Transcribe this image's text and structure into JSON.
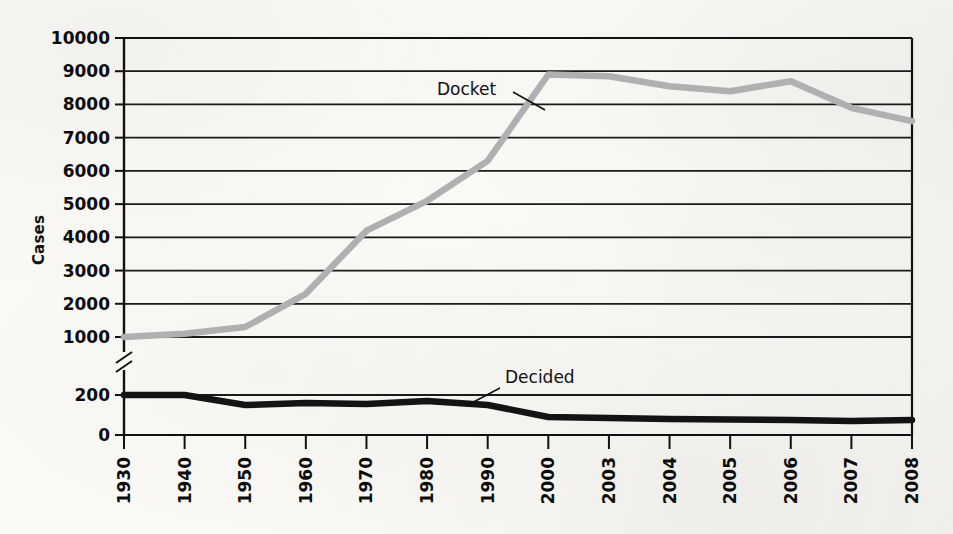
{
  "figure": {
    "y_axis_title": "Cases",
    "colors": {
      "docket_line": "#b0b0b0",
      "decided_line": "#131313",
      "axis": "#111111",
      "gridline": "#1a1a1a",
      "paper": "#fbfaf7"
    }
  },
  "annotations": {
    "docket_label": "Docket",
    "decided_label": "Decided"
  },
  "axis_break": {
    "present": true,
    "between": "1000 and 200"
  },
  "chart_data": {
    "type": "line",
    "title": "",
    "subtitle": "",
    "xlabel": "",
    "ylabel": "Cases",
    "grid": true,
    "legend_position": "inline-labels",
    "broken_y_axis": true,
    "y_upper_ticks": [
      1000,
      2000,
      3000,
      4000,
      5000,
      6000,
      7000,
      8000,
      9000,
      10000
    ],
    "y_lower_ticks": [
      0,
      200
    ],
    "ylim_upper": [
      1000,
      10000
    ],
    "ylim_lower": [
      0,
      200
    ],
    "x": [
      "1930",
      "1940",
      "1950",
      "1960",
      "1970",
      "1980",
      "1990",
      "2000",
      "2003",
      "2004",
      "2005",
      "2006",
      "2007",
      "2008"
    ],
    "categories": [
      "1930",
      "1940",
      "1950",
      "1960",
      "1970",
      "1980",
      "1990",
      "2000",
      "2003",
      "2004",
      "2005",
      "2006",
      "2007",
      "2008"
    ],
    "series": [
      {
        "name": "Docket",
        "color": "#b0b0b0",
        "values": [
          1000,
          1100,
          1300,
          2300,
          4200,
          5100,
          6300,
          8900,
          8850,
          8550,
          8400,
          8700,
          7900,
          7500
        ]
      },
      {
        "name": "Decided",
        "color": "#131313",
        "values": [
          200,
          200,
          150,
          160,
          155,
          170,
          150,
          90,
          85,
          80,
          78,
          75,
          70,
          75
        ]
      }
    ]
  }
}
